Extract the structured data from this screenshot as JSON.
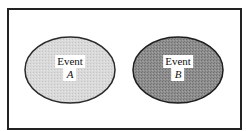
{
  "diagram": {
    "type": "venn-disjoint-events",
    "frame": {
      "border_color": "#222222",
      "background": "#ffffff"
    },
    "events": [
      {
        "id": "A",
        "label_word": "Event",
        "label_letter": "A",
        "fill": "#d6d6d6",
        "stroke": "#2a2a2a",
        "cx": 70,
        "cy": 70,
        "rx": 45,
        "ry": 33
      },
      {
        "id": "B",
        "label_word": "Event",
        "label_letter": "B",
        "fill": "#8c8c8c",
        "stroke": "#1e1e1e",
        "cx": 178,
        "cy": 70,
        "rx": 45,
        "ry": 33
      }
    ]
  }
}
